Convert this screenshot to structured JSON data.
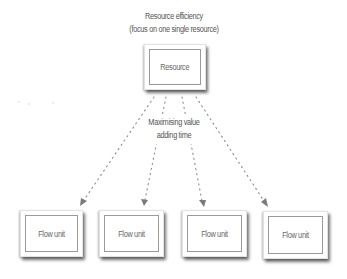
{
  "diagram": {
    "title_line1": "Resource efficiency",
    "title_line2": "(focus on one single resource)",
    "resource": {
      "label": "Resource"
    },
    "middle_label_line1": "Maximising value",
    "middle_label_line2": "adding time",
    "flow_units": [
      {
        "label": "Flow unit"
      },
      {
        "label": "Flow unit"
      },
      {
        "label": "Flow unit"
      },
      {
        "label": "Flow unit"
      }
    ],
    "colors": {
      "text": "#555555",
      "arrow": "#8a8a8a",
      "box_border": "#9a9a9a",
      "background": "#ffffff"
    },
    "arrows": [
      {
        "from": "resource",
        "to": "flow_unit_1",
        "style": "dotted"
      },
      {
        "from": "resource",
        "to": "flow_unit_2",
        "style": "dotted"
      },
      {
        "from": "resource",
        "to": "flow_unit_3",
        "style": "dotted"
      },
      {
        "from": "resource",
        "to": "flow_unit_4",
        "style": "dotted"
      }
    ]
  }
}
